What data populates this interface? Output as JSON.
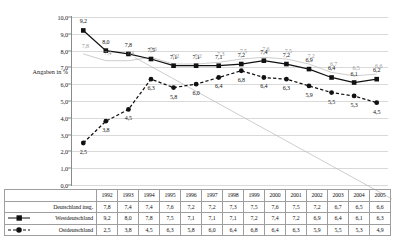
{
  "chart_data": {
    "type": "line",
    "title": "",
    "xlabel": "",
    "ylabel": "Angaben in %",
    "ylim": [
      0.0,
      10.0
    ],
    "ytick_labels": [
      "0,0",
      "1,0",
      "2,0",
      "3,0",
      "4,0",
      "5,0",
      "6,0",
      "7,0",
      "8,0",
      "9,0",
      "10,0"
    ],
    "ytick_values": [
      0,
      1,
      2,
      3,
      4,
      5,
      6,
      7,
      8,
      9,
      10
    ],
    "grid": true,
    "legend_position": "table-row-headers",
    "categories": [
      "1992",
      "1993",
      "1994",
      "1995",
      "1996",
      "1997",
      "1998",
      "1999",
      "2000",
      "2001",
      "2002",
      "2003",
      "2004",
      "2005"
    ],
    "series": [
      {
        "name": "Deutschland insg.",
        "color": "#b8b8b8",
        "marker": "none",
        "line": "solid",
        "values": [
          7.8,
          7.4,
          7.4,
          7.6,
          7.2,
          7.2,
          7.3,
          7.5,
          7.6,
          7.5,
          7.2,
          6.7,
          6.5,
          6.6
        ],
        "labels": [
          "7,8",
          "7,4",
          "7,4",
          "7,6",
          "7,2",
          "7,2",
          "7,3",
          "7,5",
          "7,6",
          "7,5",
          "7,2",
          "6,7",
          "6,5",
          "6,6"
        ]
      },
      {
        "name": "Westdeutschland",
        "color": "#111111",
        "marker": "square",
        "line": "solid",
        "values": [
          9.2,
          8.0,
          7.8,
          7.5,
          7.1,
          7.1,
          7.1,
          7.2,
          7.4,
          7.2,
          6.9,
          6.4,
          6.1,
          6.3
        ],
        "labels": [
          "9,2",
          "8,0",
          "7,8",
          "7,5",
          "7,1",
          "7,1",
          "7,1",
          "7,2",
          "7,4",
          "7,2",
          "6,9",
          "6,4",
          "6,1",
          "6,2"
        ]
      },
      {
        "name": "Ostdeutschland",
        "color": "#111111",
        "marker": "circle",
        "line": "dashed",
        "values": [
          2.5,
          3.8,
          4.5,
          6.3,
          5.8,
          6.0,
          6.4,
          6.8,
          6.4,
          6.3,
          5.9,
          5.5,
          5.3,
          4.9
        ],
        "labels": [
          "2,5",
          "3,8",
          "4,5",
          "6,3",
          "5,8",
          "6,0",
          "6,4",
          "6,8",
          "6,4",
          "6,3",
          "5,9",
          "5,5",
          "5,3",
          "4,5"
        ]
      }
    ]
  },
  "table": {
    "corner_label": "",
    "column_headers": [
      "1992",
      "1993",
      "1994",
      "1995",
      "1996",
      "1997",
      "1998",
      "1999",
      "2000",
      "2001",
      "2002",
      "2003",
      "2004",
      "2005"
    ],
    "rows": [
      {
        "label": "Deutschland insg.",
        "marker": "none",
        "values": [
          "7,8",
          "7,4",
          "7,4",
          "7,6",
          "7,2",
          "7,2",
          "7,3",
          "7,5",
          "7,6",
          "7,5",
          "7,2",
          "6,7",
          "6,5",
          "6,6"
        ]
      },
      {
        "label": "Westdeutschland",
        "marker": "square",
        "values": [
          "9,2",
          "8,0",
          "7,8",
          "7,5",
          "7,1",
          "7,1",
          "7,1",
          "7,2",
          "7,4",
          "7,2",
          "6,9",
          "6,4",
          "6,1",
          "6,3"
        ]
      },
      {
        "label": "Ostdeutschland",
        "marker": "circle",
        "values": [
          "2,5",
          "3,8",
          "4,5",
          "6,3",
          "5,8",
          "6,0",
          "6,4",
          "6,8",
          "6,4",
          "6,3",
          "5,9",
          "5,5",
          "5,3",
          "4,9"
        ]
      }
    ]
  },
  "colors": {
    "grid": "#d9d9d9",
    "axis": "#8a8a8a",
    "gray_series": "#b8b8b8",
    "dark_series": "#111111",
    "table_border": "#9e9e9e"
  }
}
